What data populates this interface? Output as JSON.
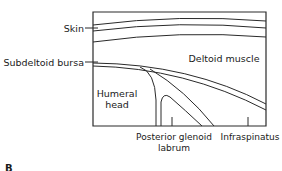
{
  "diagram": {
    "panel_label": "B",
    "labels": {
      "skin": "Skin",
      "subdeltoid_bursa": "Subdeltoid bursa",
      "deltoid_muscle": "Deltoid muscle",
      "humeral_head_line1": "Humeral",
      "humeral_head_line2": "head",
      "posterior_glenoid_line1": "Posterior glenoid",
      "posterior_glenoid_line2": "labrum",
      "infraspinatus": "Infraspinatus"
    },
    "colors": {
      "line": "#2a2a2a",
      "text": "#1a1a1a",
      "background": "#ffffff"
    }
  }
}
